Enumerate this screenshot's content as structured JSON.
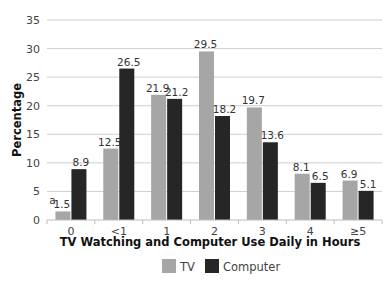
{
  "chart_data": {
    "type": "bar",
    "title": "",
    "xlabel": "TV Watching and Computer Use Daily in Hours",
    "ylabel": "Percentage",
    "ylim": [
      0,
      35
    ],
    "yticks": [
      0,
      5,
      10,
      15,
      20,
      25,
      30,
      35
    ],
    "grid": true,
    "legend_position": "bottom",
    "categories": [
      "0",
      "<1",
      "1",
      "2",
      "3",
      "4",
      "≥5"
    ],
    "series": [
      {
        "name": "TV",
        "color": "#a6a6a6",
        "values": [
          1.5,
          12.5,
          21.9,
          29.5,
          19.7,
          8.1,
          6.9
        ]
      },
      {
        "name": "Computer",
        "color": "#262626",
        "values": [
          8.9,
          26.5,
          21.2,
          18.2,
          13.6,
          6.5,
          5.1
        ]
      }
    ],
    "annotations": [
      {
        "text": "a",
        "target": "TV, category 0",
        "note": "superscript footnote marker before 1.5"
      }
    ]
  }
}
